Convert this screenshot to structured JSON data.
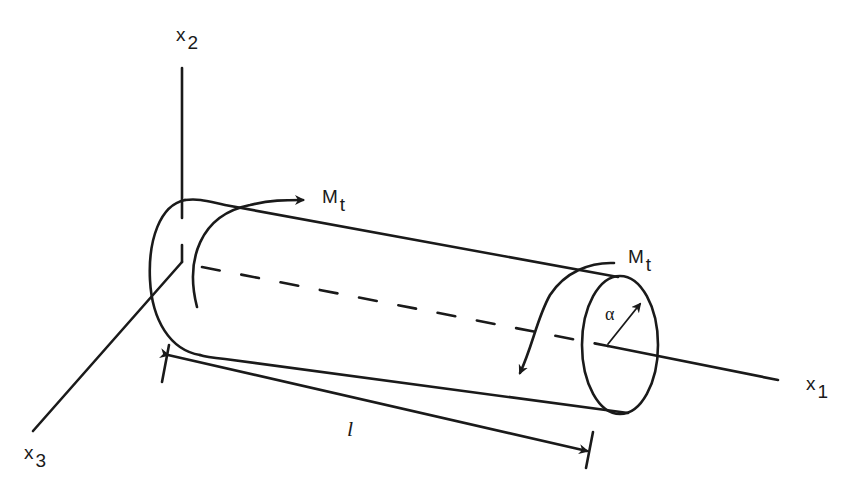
{
  "figure": {
    "colors": {
      "stroke": "#1a1a1a",
      "background": "#ffffff"
    }
  },
  "axes": {
    "x1": {
      "base": "x",
      "sub": "1"
    },
    "x2": {
      "base": "x",
      "sub": "2"
    },
    "x3": {
      "base": "x",
      "sub": "3"
    }
  },
  "loads": {
    "left_moment": {
      "base": "M",
      "sub": "t"
    },
    "right_moment": {
      "base": "M",
      "sub": "t"
    }
  },
  "dimensions": {
    "length": "l",
    "radius": "α"
  }
}
